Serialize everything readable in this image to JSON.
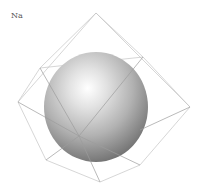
{
  "diagram": {
    "element_label": "Na",
    "colors": {
      "wire": "#b4b4b4",
      "sphere_highlight": "#ffffff",
      "sphere_mid": "#bdbdbd",
      "sphere_shadow": "#6a6a6a",
      "label": "#555555"
    }
  }
}
